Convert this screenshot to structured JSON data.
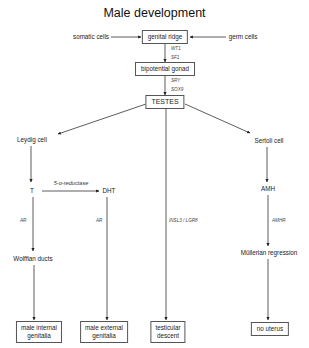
{
  "title": "Male development",
  "nodes": {
    "somatic_cells": {
      "label": "somatic cells",
      "x": 91,
      "y": 37
    },
    "germ_cells": {
      "label": "germ cells",
      "x": 243,
      "y": 37
    },
    "genital_ridge": {
      "label": "genital ridge",
      "x": 165,
      "y": 37
    },
    "bipotential_gonad": {
      "label": "bipotential gonad",
      "x": 165,
      "y": 69
    },
    "testes": {
      "label": "TESTES",
      "x": 165,
      "y": 102
    },
    "leydig_cell": {
      "label": "Leydig cell",
      "x": 32,
      "y": 140
    },
    "sertoli_cell": {
      "label": "Sertoli cell",
      "x": 269,
      "y": 141
    },
    "t": {
      "label": "T",
      "x": 32,
      "y": 191
    },
    "dht": {
      "label": "DHT",
      "x": 109,
      "y": 191
    },
    "amh": {
      "label": "AMH",
      "x": 268,
      "y": 189
    },
    "wolffian_ducts": {
      "label": "Wolffian ducts",
      "x": 33,
      "y": 259
    },
    "mullerian_regression": {
      "label": "Müllerian regression",
      "x": 269,
      "y": 253
    },
    "male_internal_genitalia": {
      "label_line1": "male internal",
      "label_line2": "genitalia",
      "x": 39,
      "y": 332
    },
    "male_external_genitalia": {
      "label_line1": "male external",
      "label_line2": "genitalia",
      "x": 104,
      "y": 332
    },
    "testicular_descent": {
      "label_line1": "testicular",
      "label_line2": "descent",
      "x": 168,
      "y": 332
    },
    "no_uterus": {
      "label": "no uterus",
      "x": 270,
      "y": 329
    }
  },
  "gene_labels": {
    "wt1": {
      "label": "WT1",
      "x": 171,
      "y": 48
    },
    "sf1": {
      "label": "SF1",
      "x": 171,
      "y": 57
    },
    "sry": {
      "label": "SRY",
      "x": 171,
      "y": 80
    },
    "sox9": {
      "label": "SOX9",
      "x": 171,
      "y": 89
    },
    "ar_left": {
      "label": "AR",
      "x": 20,
      "y": 220
    },
    "ar_right": {
      "label": "AR",
      "x": 96,
      "y": 220
    },
    "insl3_lgr8": {
      "label": "INSL3 / LGR8",
      "x": 169,
      "y": 220
    },
    "amhr": {
      "label": "AMHR",
      "x": 272,
      "y": 220
    }
  },
  "enzyme_label": {
    "label": "5-α-reductase",
    "x": 71,
    "y": 183
  },
  "edges": [
    {
      "from": "somatic_cells",
      "to": "genital_ridge",
      "x1": 111,
      "y1": 37,
      "x2": 141,
      "y2": 37
    },
    {
      "from": "germ_cells",
      "to": "genital_ridge",
      "x1": 226,
      "y1": 37,
      "x2": 190,
      "y2": 37
    },
    {
      "from": "genital_ridge",
      "to": "bipotential_gonad",
      "x1": 165,
      "y1": 44,
      "x2": 165,
      "y2": 62
    },
    {
      "from": "bipotential_gonad",
      "to": "testes",
      "x1": 165,
      "y1": 76,
      "x2": 165,
      "y2": 95
    },
    {
      "from": "testes",
      "to": "leydig_cell",
      "x1": 146,
      "y1": 104,
      "x2": 58,
      "y2": 134
    },
    {
      "from": "testes",
      "to": "sertoli_cell",
      "x1": 185,
      "y1": 104,
      "x2": 250,
      "y2": 133
    },
    {
      "from": "testes",
      "to": "testicular_descent",
      "x1": 166,
      "y1": 109,
      "x2": 166,
      "y2": 320
    },
    {
      "from": "leydig_cell",
      "to": "t",
      "x1": 31,
      "y1": 146,
      "x2": 31,
      "y2": 182
    },
    {
      "from": "t",
      "to": "dht",
      "x1": 42,
      "y1": 191,
      "x2": 99,
      "y2": 191
    },
    {
      "from": "t",
      "to": "wolffian_ducts",
      "x1": 33,
      "y1": 197,
      "x2": 33,
      "y2": 251
    },
    {
      "from": "wolffian_ducts",
      "to": "male_internal_genitalia",
      "x1": 34,
      "y1": 265,
      "x2": 34,
      "y2": 320
    },
    {
      "from": "dht",
      "to": "male_external_genitalia",
      "x1": 107,
      "y1": 197,
      "x2": 107,
      "y2": 320
    },
    {
      "from": "sertoli_cell",
      "to": "amh",
      "x1": 267,
      "y1": 147,
      "x2": 267,
      "y2": 182
    },
    {
      "from": "amh",
      "to": "mullerian_regression",
      "x1": 268,
      "y1": 195,
      "x2": 268,
      "y2": 246
    },
    {
      "from": "mullerian_regression",
      "to": "no_uterus",
      "x1": 268,
      "y1": 259,
      "x2": 268,
      "y2": 320
    }
  ],
  "colors": {
    "line": "#333333",
    "box_border": "#555555",
    "text": "#222222",
    "background": "#ffffff"
  }
}
